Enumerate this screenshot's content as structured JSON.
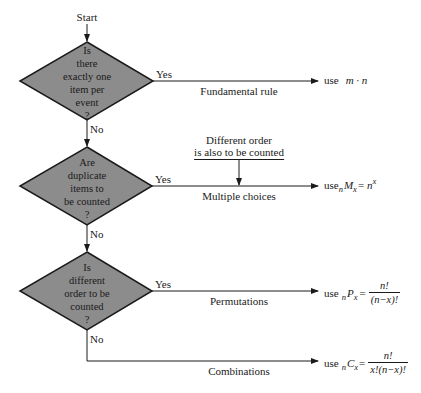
{
  "flowchart": {
    "start_label": "Start",
    "decisions": [
      {
        "lines": [
          "Is",
          "there",
          "exactly one",
          "item per",
          "event",
          "?"
        ],
        "yes_label": "Yes",
        "no_label": "No",
        "branch_label": "Fundamental rule",
        "result_prefix": "use",
        "result_formula": "m · n"
      },
      {
        "lines": [
          "Are",
          "duplicate",
          "items to",
          "be counted",
          "?"
        ],
        "yes_label": "Yes",
        "no_label": "No",
        "branch_label": "Multiple choices",
        "note_lines": [
          "Different order",
          "is also to be counted"
        ],
        "result_prefix": "use",
        "result_formula": {
          "pre_sub": "n",
          "symbol": "M",
          "post_sub": "x",
          "equals": "=",
          "rhs_base": "n",
          "rhs_sup": "x"
        }
      },
      {
        "lines": [
          "Is",
          "different",
          "order to be",
          "counted",
          "?"
        ],
        "yes_label": "Yes",
        "no_label": "No",
        "branch_label": "Permutations",
        "result_prefix": "use",
        "result_formula": {
          "pre_sub": "n",
          "symbol": "P",
          "post_sub": "x",
          "equals": "=",
          "numerator": "n!",
          "denominator": "(n−x)!"
        }
      }
    ],
    "final": {
      "branch_label": "Combinations",
      "result_prefix": "use",
      "result_formula": {
        "pre_sub": "n",
        "symbol": "C",
        "post_sub": "x",
        "equals": "=",
        "numerator": "n!",
        "denominator": "x!(n−x)!"
      }
    },
    "colors": {
      "diamond_fill": "#8c8c8c",
      "stroke": "#1a1a1a",
      "background": "#ffffff"
    }
  }
}
